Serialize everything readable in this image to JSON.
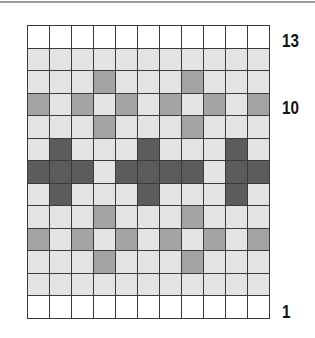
{
  "chart": {
    "type": "knitting-colorwork-chart",
    "columns": 11,
    "rows": 13,
    "colors": {
      "w": "#ffffff",
      "l": "#e4e4e4",
      "m": "#a4a4a4",
      "d": "#5c5c5c"
    },
    "grid_rows_top_to_bottom": [
      "wwwwwwwwwww",
      "lllllllllll",
      "lllmlllmlll",
      "mlmlmlmlmlm",
      "lllmlllmlll",
      "ldllldllldl",
      "dddlddddlddd",
      "ldllldllldl",
      "lllmlllmlll",
      "mlmlmlmlmlm",
      "lllmlllmlll",
      "lllllllllll",
      "wwwwwwwwwww"
    ],
    "row_labels": [
      {
        "text": "13",
        "row": 13
      },
      {
        "text": "10",
        "row": 10
      },
      {
        "text": "1",
        "row": 1
      }
    ]
  }
}
